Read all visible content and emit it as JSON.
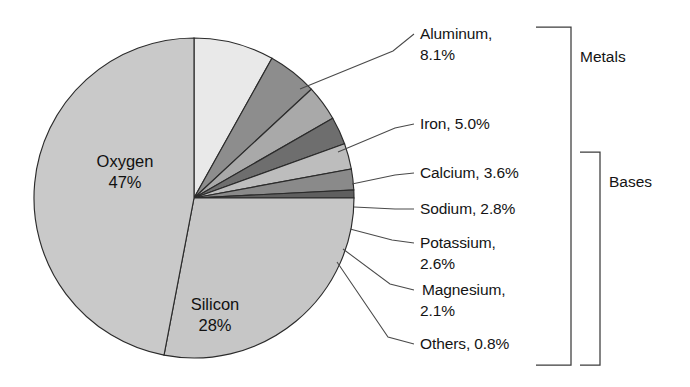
{
  "chart_data": {
    "type": "pie",
    "title": "",
    "unit": "percent",
    "categories": [
      "Oxygen",
      "Silicon",
      "Aluminum",
      "Iron",
      "Calcium",
      "Sodium",
      "Potassium",
      "Magnesium",
      "Others"
    ],
    "values": [
      47,
      28,
      8.1,
      5.0,
      3.6,
      2.8,
      2.6,
      2.1,
      0.8
    ],
    "value_labels": [
      "47%",
      "28%",
      "8.1%",
      "5.0%",
      "3.6%",
      "2.8%",
      "2.6%",
      "2.1%",
      "0.8%"
    ],
    "legend_position": "right",
    "grid": false,
    "slice_colors": [
      "#c9c9c9",
      "#c6c6c6",
      "#e9e9e9",
      "#8d8d8d",
      "#a9a9a9",
      "#6e6e6e",
      "#bdbdbd",
      "#8a8a8a",
      "#5f5f5f"
    ],
    "start_angle_deg": -90,
    "direction": "clockwise",
    "groups": [
      {
        "name": "Metals",
        "members": [
          "Aluminum",
          "Iron",
          "Calcium",
          "Sodium",
          "Potassium",
          "Magnesium",
          "Others"
        ]
      },
      {
        "name": "Bases",
        "members": [
          "Calcium",
          "Sodium",
          "Potassium",
          "Magnesium",
          "Others"
        ]
      }
    ]
  },
  "pie": {
    "inner_labels": [
      {
        "name": "Oxygen",
        "line1": "Oxygen",
        "line2": "47%"
      },
      {
        "name": "Silicon",
        "line1": "Silicon",
        "line2": "28%"
      }
    ]
  },
  "callouts": [
    {
      "name": "aluminum",
      "line1": "Aluminum,",
      "line2": "8.1%"
    },
    {
      "name": "iron",
      "line1": "Iron, 5.0%",
      "line2": ""
    },
    {
      "name": "calcium",
      "line1": "Calcium, 3.6%",
      "line2": ""
    },
    {
      "name": "sodium",
      "line1": "Sodium, 2.8%",
      "line2": ""
    },
    {
      "name": "potassium",
      "line1": "Potassium,",
      "line2": "2.6%"
    },
    {
      "name": "magnesium",
      "line1": "Magnesium,",
      "line2": "2.1%"
    },
    {
      "name": "others",
      "line1": "Others, 0.8%",
      "line2": ""
    }
  ],
  "brackets": [
    {
      "name": "metals",
      "label": "Metals"
    },
    {
      "name": "bases",
      "label": "Bases"
    }
  ],
  "colors": {
    "background": "#ffffff",
    "outline": "#2b2b2b",
    "text": "#141414",
    "leader": "#4a4a4a"
  }
}
